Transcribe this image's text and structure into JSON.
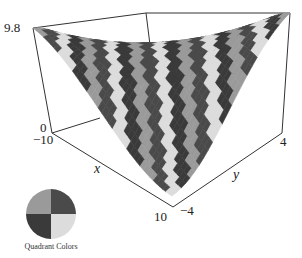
{
  "chart_data": {
    "type": "surface3d",
    "title": "",
    "xlabel": "x",
    "ylabel": "y",
    "zlabel": "",
    "xlim": [
      -10,
      10
    ],
    "ylim": [
      -4,
      4
    ],
    "zlim": [
      0,
      9.8
    ],
    "x_ticks": [
      "-10",
      "10"
    ],
    "y_ticks": [
      "-4",
      "4"
    ],
    "z_ticks": [
      "0",
      "9.8"
    ],
    "surface_description": "Twisted trough surface, high ridge along x=-10 side and at y=4 side, valley running diagonally to front corner (x=10, y=-4); colored in stripes cycling through four quadrant gray tones",
    "legend": {
      "title": "Quadrant Colors",
      "quadrants": [
        {
          "position": "top-left",
          "color": "#9a9a9a"
        },
        {
          "position": "top-right",
          "color": "#4a4a4a"
        },
        {
          "position": "bottom-left",
          "color": "#3a3a3a"
        },
        {
          "position": "bottom-right",
          "color": "#dcdcdc"
        }
      ]
    }
  },
  "labels": {
    "z_max": "9.8",
    "z_min": "0",
    "x_min": "−10",
    "x_max": "10",
    "y_min": "−4",
    "y_max": "4",
    "x_axis": "x",
    "y_axis": "y",
    "legend_caption": "Quadrant Colors"
  },
  "colors": {
    "stripe_1": "#9a9a9a",
    "stripe_2": "#4a4a4a",
    "stripe_3": "#dcdcdc",
    "stripe_4": "#3a3a3a",
    "box_line": "#333333"
  }
}
